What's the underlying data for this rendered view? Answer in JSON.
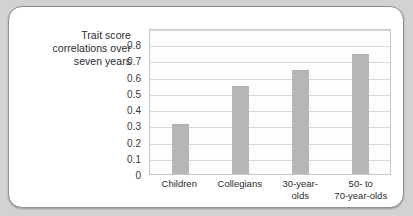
{
  "chart_data": {
    "type": "bar",
    "title": "",
    "subtitle": "",
    "xlabel": "",
    "ylabel": "Trait score correlations over seven years",
    "ylabel_lines": [
      "Trait score",
      "correlations over",
      "seven years"
    ],
    "categories": [
      "Children",
      "Collegians",
      "30-year-olds",
      "50- to 70-year-olds"
    ],
    "category_lines": [
      [
        "Children"
      ],
      [
        "Collegians"
      ],
      [
        "30-year-",
        "olds"
      ],
      [
        "50-  to",
        "70-year-olds"
      ]
    ],
    "values": [
      0.31,
      0.54,
      0.64,
      0.74
    ],
    "ylim": [
      0,
      0.9
    ],
    "yticks": [
      0,
      0.1,
      0.2,
      0.3,
      0.4,
      0.5,
      0.6,
      0.7,
      0.8
    ],
    "ytick_labels": [
      "0",
      "0.1",
      "0.2",
      "0.3",
      "0.4",
      "0.5",
      "0.6",
      "0.7",
      "0.8"
    ],
    "gridlines": [
      0.1,
      0.2,
      0.3,
      0.4,
      0.5,
      0.6,
      0.7,
      0.8,
      0.9
    ],
    "grid": true,
    "legend": null,
    "legend_position": "none",
    "bar_color": "#b6b6b6",
    "plot_background": "#fdfdfd",
    "grid_color": "#d8d8d8",
    "card_background": "#ffffff",
    "page_background": "#d2d2d2",
    "text_color": "#2b2b2b"
  }
}
